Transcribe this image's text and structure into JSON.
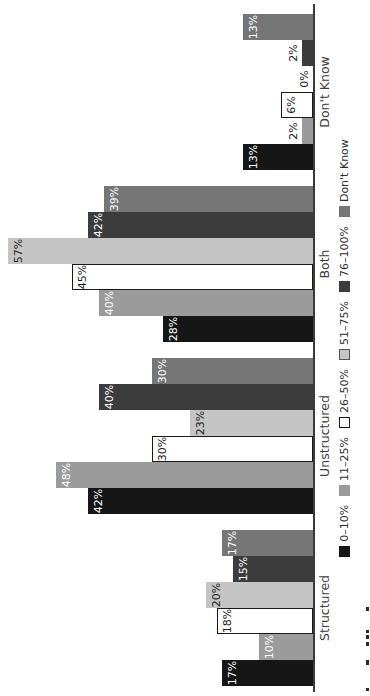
{
  "chart_data": {
    "type": "bar",
    "title": "",
    "orientation": "figure rotated 90deg counter-clockwise (sideways page)",
    "categories": [
      "Structured",
      "Unstructured",
      "Both",
      "Don't Know"
    ],
    "series": [
      {
        "name": "0–10%",
        "color": "#161616",
        "border": "",
        "label_color": "#ffffff",
        "values": [
          17,
          42,
          28,
          13
        ]
      },
      {
        "name": "11–25%",
        "color": "#9b9b9b",
        "border": "",
        "label_color": "#ffffff",
        "values": [
          10,
          48,
          40,
          2
        ]
      },
      {
        "name": "26–50%",
        "color": "#ffffff",
        "border": "#1a1a1a",
        "label_color": "#1a1a1a",
        "values": [
          18,
          30,
          45,
          6
        ]
      },
      {
        "name": "51–75%",
        "color": "#c5c5c5",
        "border": "",
        "label_color": "#222222",
        "values": [
          20,
          23,
          57,
          0
        ]
      },
      {
        "name": "76–100%",
        "color": "#3c3c3c",
        "border": "",
        "label_color": "#ffffff",
        "values": [
          15,
          40,
          42,
          2
        ]
      },
      {
        "name": "Don't Know",
        "color": "#767676",
        "border": "",
        "label_color": "#ffffff",
        "values": [
          17,
          30,
          39,
          13
        ]
      }
    ],
    "value_labels": "percent shown at end of every bar; small values (2%, 0%) printed outside the bar in black",
    "value_axis_visible": false,
    "ylim": [
      0,
      60
    ],
    "grid": false,
    "legend_position": "bottom of original figure (right edge of rotated image)",
    "colors": {
      "background": "#ffffff",
      "axis_line": "#3a3a3a",
      "category_text": "#3d3d3d",
      "legend_text": "#2e2e2e",
      "outside_label_text": "#1a1a1a"
    }
  }
}
